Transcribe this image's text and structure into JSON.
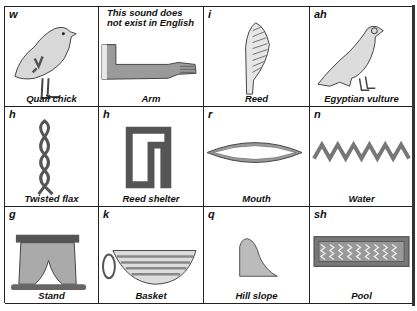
{
  "chart_title": "",
  "cells": [
    {
      "sound": "w",
      "name": "Quail chick",
      "icon": "quail-chick-glyph"
    },
    {
      "sound": "",
      "note_line1": "This sound does",
      "note_line2": "not exist in English",
      "name": "Arm",
      "icon": "arm-glyph"
    },
    {
      "sound": "i",
      "name": "Reed",
      "icon": "reed-glyph"
    },
    {
      "sound": "ah",
      "name": "Egyptian vulture",
      "icon": "vulture-glyph"
    },
    {
      "sound": "h",
      "name": "Twisted flax",
      "icon": "twisted-flax-glyph"
    },
    {
      "sound": "h",
      "name": "Reed shelter",
      "icon": "reed-shelter-glyph"
    },
    {
      "sound": "r",
      "name": "Mouth",
      "icon": "mouth-glyph"
    },
    {
      "sound": "n",
      "name": "Water",
      "icon": "water-glyph"
    },
    {
      "sound": "g",
      "name": "Stand",
      "icon": "stand-glyph"
    },
    {
      "sound": "k",
      "name": "Basket",
      "icon": "basket-glyph"
    },
    {
      "sound": "q",
      "name": "Hill slope",
      "icon": "hill-slope-glyph"
    },
    {
      "sound": "sh",
      "name": "Pool",
      "icon": "pool-glyph"
    }
  ]
}
